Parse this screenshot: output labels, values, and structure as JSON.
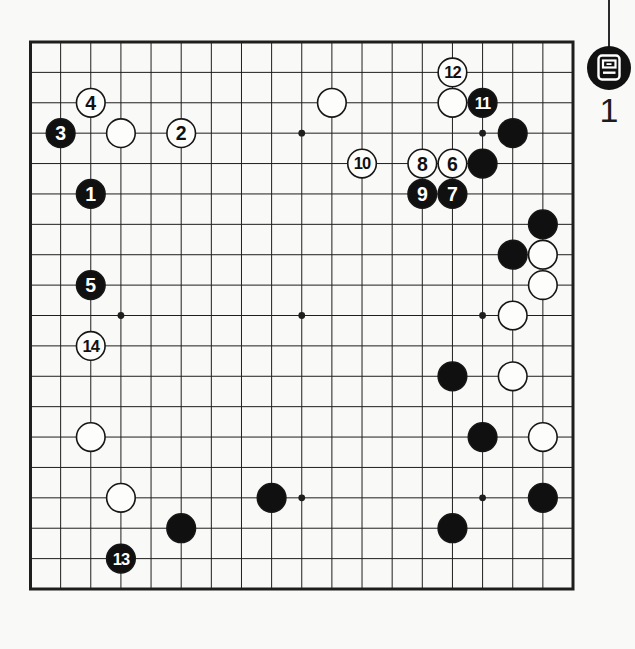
{
  "figure_marker": {
    "icon": "diagram-icon",
    "number": "1"
  },
  "board": {
    "size": 19,
    "geometry": {
      "left": 30.5,
      "top": 42,
      "right": 573,
      "bottom": 589
    },
    "colors": {
      "paper": "#f9f9f7",
      "line": "#1e1e1e",
      "black_stone": "#101010",
      "white_stone": "#fdfdfc",
      "black_number": "#ffffff",
      "white_number": "#111111"
    },
    "star_points": [
      [
        3,
        3
      ],
      [
        9,
        3
      ],
      [
        15,
        3
      ],
      [
        3,
        9
      ],
      [
        9,
        9
      ],
      [
        15,
        9
      ],
      [
        3,
        15
      ],
      [
        9,
        15
      ],
      [
        15,
        15
      ]
    ],
    "numbered_moves": [
      {
        "number": "1",
        "color": "black",
        "col": 2,
        "row": 5
      },
      {
        "number": "2",
        "color": "white",
        "col": 5,
        "row": 3
      },
      {
        "number": "3",
        "color": "black",
        "col": 1,
        "row": 3
      },
      {
        "number": "4",
        "color": "white",
        "col": 2,
        "row": 2
      },
      {
        "number": "5",
        "color": "black",
        "col": 2,
        "row": 8
      },
      {
        "number": "6",
        "color": "white",
        "col": 14,
        "row": 4
      },
      {
        "number": "7",
        "color": "black",
        "col": 14,
        "row": 5
      },
      {
        "number": "8",
        "color": "white",
        "col": 13,
        "row": 4
      },
      {
        "number": "9",
        "color": "black",
        "col": 13,
        "row": 5
      },
      {
        "number": "10",
        "color": "white",
        "col": 11,
        "row": 4
      },
      {
        "number": "11",
        "color": "black",
        "col": 15,
        "row": 2
      },
      {
        "number": "12",
        "color": "white",
        "col": 14,
        "row": 1
      },
      {
        "number": "13",
        "color": "black",
        "col": 3,
        "row": 17
      },
      {
        "number": "14",
        "color": "white",
        "col": 2,
        "row": 10
      }
    ],
    "plain_stones": [
      {
        "color": "white",
        "col": 3,
        "row": 3
      },
      {
        "color": "white",
        "col": 10,
        "row": 2
      },
      {
        "color": "white",
        "col": 14,
        "row": 2
      },
      {
        "color": "black",
        "col": 16,
        "row": 3
      },
      {
        "color": "black",
        "col": 15,
        "row": 4
      },
      {
        "color": "black",
        "col": 17,
        "row": 6
      },
      {
        "color": "black",
        "col": 16,
        "row": 7
      },
      {
        "color": "white",
        "col": 17,
        "row": 7
      },
      {
        "color": "white",
        "col": 17,
        "row": 8
      },
      {
        "color": "white",
        "col": 16,
        "row": 9
      },
      {
        "color": "black",
        "col": 14,
        "row": 11
      },
      {
        "color": "white",
        "col": 16,
        "row": 11
      },
      {
        "color": "black",
        "col": 15,
        "row": 13
      },
      {
        "color": "white",
        "col": 17,
        "row": 13
      },
      {
        "color": "black",
        "col": 17,
        "row": 15
      },
      {
        "color": "black",
        "col": 14,
        "row": 16
      },
      {
        "color": "white",
        "col": 2,
        "row": 13
      },
      {
        "color": "white",
        "col": 3,
        "row": 15
      },
      {
        "color": "black",
        "col": 8,
        "row": 15
      },
      {
        "color": "black",
        "col": 5,
        "row": 16
      }
    ]
  }
}
